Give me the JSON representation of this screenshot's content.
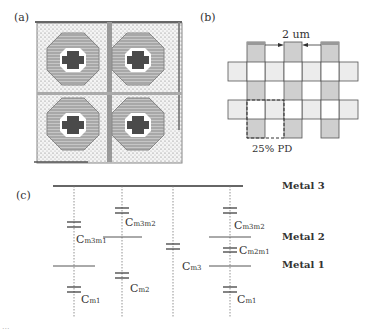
{
  "panels": {
    "a": {
      "label": "(a)"
    },
    "b": {
      "label": "(b)",
      "dimension_label": "2 um",
      "region_label": "25% PD",
      "colors": {
        "vertical_bar": "#cfcfcf",
        "horizontal_bar": "#ececec",
        "outline": "#444444"
      }
    },
    "c": {
      "label": "(c)",
      "metal_labels": {
        "m3": "Metal 3",
        "m2": "Metal 2",
        "m1": "Metal 1"
      },
      "capacitors": [
        {
          "name": "C",
          "sub": "m3m1"
        },
        {
          "name": "C",
          "sub": "m1"
        },
        {
          "name": "C",
          "sub": "m3m2"
        },
        {
          "name": "C",
          "sub": "m2"
        },
        {
          "name": "C",
          "sub": "m3"
        },
        {
          "name": "C",
          "sub": "m3m2"
        },
        {
          "name": "C",
          "sub": "m2m1"
        },
        {
          "name": "C",
          "sub": "m1"
        }
      ]
    }
  },
  "footer_partial": "..."
}
